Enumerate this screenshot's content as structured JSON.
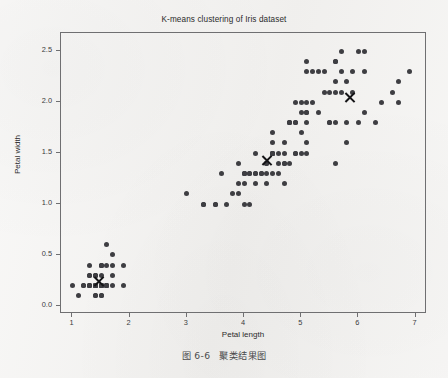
{
  "page": {
    "background_color": "#f3f2f0",
    "caption_number": "图 6-6",
    "caption_text": "聚类结果图"
  },
  "chart_data": {
    "type": "scatter",
    "title": "K-means clustering of Iris dataset",
    "xlabel": "Petal length",
    "ylabel": "Petal width",
    "xlim": [
      0.8,
      7.2
    ],
    "ylim": [
      -0.08,
      2.68
    ],
    "xticks": [
      1,
      2,
      3,
      4,
      5,
      6,
      7
    ],
    "xticklabels": [
      "1",
      "2",
      "3",
      "4",
      "5",
      "6",
      "7"
    ],
    "yticks": [
      0.0,
      0.5,
      1.0,
      1.5,
      2.0,
      2.5
    ],
    "yticklabels": [
      "0.0",
      "0.5",
      "1.0",
      "1.5",
      "2.0",
      "2.5"
    ],
    "grid": false,
    "legend": false,
    "marker_color": "#3e3e42",
    "centroid_color": "#141416",
    "centroid_marker": "x",
    "series": [
      {
        "name": "iris-samples",
        "marker": "o",
        "points": [
          [
            1.4,
            0.2
          ],
          [
            1.4,
            0.2
          ],
          [
            1.3,
            0.2
          ],
          [
            1.5,
            0.2
          ],
          [
            1.4,
            0.2
          ],
          [
            1.7,
            0.4
          ],
          [
            1.4,
            0.3
          ],
          [
            1.5,
            0.2
          ],
          [
            1.4,
            0.2
          ],
          [
            1.5,
            0.1
          ],
          [
            1.5,
            0.2
          ],
          [
            1.6,
            0.2
          ],
          [
            1.4,
            0.1
          ],
          [
            1.1,
            0.1
          ],
          [
            1.2,
            0.2
          ],
          [
            1.5,
            0.4
          ],
          [
            1.3,
            0.4
          ],
          [
            1.4,
            0.3
          ],
          [
            1.7,
            0.3
          ],
          [
            1.5,
            0.3
          ],
          [
            1.7,
            0.2
          ],
          [
            1.5,
            0.4
          ],
          [
            1.0,
            0.2
          ],
          [
            1.7,
            0.5
          ],
          [
            1.9,
            0.2
          ],
          [
            1.6,
            0.2
          ],
          [
            1.6,
            0.4
          ],
          [
            1.5,
            0.2
          ],
          [
            1.4,
            0.2
          ],
          [
            1.6,
            0.2
          ],
          [
            1.6,
            0.2
          ],
          [
            1.5,
            0.4
          ],
          [
            1.5,
            0.1
          ],
          [
            1.4,
            0.2
          ],
          [
            1.5,
            0.2
          ],
          [
            1.2,
            0.2
          ],
          [
            1.3,
            0.2
          ],
          [
            1.4,
            0.1
          ],
          [
            1.3,
            0.2
          ],
          [
            1.5,
            0.2
          ],
          [
            1.3,
            0.3
          ],
          [
            1.3,
            0.3
          ],
          [
            1.3,
            0.2
          ],
          [
            1.6,
            0.6
          ],
          [
            1.9,
            0.4
          ],
          [
            1.4,
            0.3
          ],
          [
            1.6,
            0.2
          ],
          [
            1.4,
            0.2
          ],
          [
            1.5,
            0.2
          ],
          [
            1.4,
            0.2
          ],
          [
            4.7,
            1.4
          ],
          [
            4.5,
            1.5
          ],
          [
            4.9,
            1.5
          ],
          [
            4.0,
            1.3
          ],
          [
            4.6,
            1.5
          ],
          [
            4.5,
            1.3
          ],
          [
            4.7,
            1.6
          ],
          [
            3.3,
            1.0
          ],
          [
            4.6,
            1.3
          ],
          [
            3.9,
            1.4
          ],
          [
            3.5,
            1.0
          ],
          [
            4.2,
            1.5
          ],
          [
            4.0,
            1.0
          ],
          [
            4.7,
            1.4
          ],
          [
            3.6,
            1.3
          ],
          [
            4.4,
            1.4
          ],
          [
            4.5,
            1.5
          ],
          [
            4.1,
            1.0
          ],
          [
            4.5,
            1.5
          ],
          [
            3.9,
            1.1
          ],
          [
            4.8,
            1.8
          ],
          [
            4.0,
            1.3
          ],
          [
            4.9,
            1.5
          ],
          [
            4.7,
            1.2
          ],
          [
            4.3,
            1.3
          ],
          [
            4.4,
            1.4
          ],
          [
            4.8,
            1.4
          ],
          [
            5.0,
            1.7
          ],
          [
            4.5,
            1.5
          ],
          [
            3.5,
            1.0
          ],
          [
            3.8,
            1.1
          ],
          [
            3.7,
            1.0
          ],
          [
            3.9,
            1.2
          ],
          [
            5.1,
            1.6
          ],
          [
            4.5,
            1.5
          ],
          [
            4.5,
            1.6
          ],
          [
            4.7,
            1.5
          ],
          [
            4.4,
            1.3
          ],
          [
            4.1,
            1.3
          ],
          [
            4.0,
            1.3
          ],
          [
            4.4,
            1.2
          ],
          [
            4.6,
            1.4
          ],
          [
            4.0,
            1.2
          ],
          [
            3.3,
            1.0
          ],
          [
            4.2,
            1.3
          ],
          [
            4.2,
            1.2
          ],
          [
            4.2,
            1.3
          ],
          [
            4.3,
            1.3
          ],
          [
            3.0,
            1.1
          ],
          [
            4.1,
            1.3
          ],
          [
            6.0,
            2.5
          ],
          [
            5.1,
            1.9
          ],
          [
            5.9,
            2.1
          ],
          [
            5.6,
            1.8
          ],
          [
            5.8,
            2.2
          ],
          [
            6.6,
            2.1
          ],
          [
            4.5,
            1.7
          ],
          [
            6.3,
            1.8
          ],
          [
            5.8,
            1.8
          ],
          [
            6.1,
            2.5
          ],
          [
            5.1,
            2.0
          ],
          [
            5.3,
            1.9
          ],
          [
            5.5,
            2.1
          ],
          [
            5.0,
            2.0
          ],
          [
            5.1,
            2.4
          ],
          [
            5.3,
            2.3
          ],
          [
            5.5,
            1.8
          ],
          [
            6.7,
            2.2
          ],
          [
            6.9,
            2.3
          ],
          [
            5.0,
            1.5
          ],
          [
            5.7,
            2.3
          ],
          [
            4.9,
            2.0
          ],
          [
            6.7,
            2.0
          ],
          [
            4.9,
            1.8
          ],
          [
            5.7,
            2.1
          ],
          [
            6.0,
            1.8
          ],
          [
            4.8,
            1.8
          ],
          [
            4.9,
            1.8
          ],
          [
            5.6,
            2.1
          ],
          [
            5.8,
            1.6
          ],
          [
            6.1,
            1.9
          ],
          [
            6.4,
            2.0
          ],
          [
            5.6,
            2.2
          ],
          [
            5.1,
            1.5
          ],
          [
            5.6,
            1.4
          ],
          [
            6.1,
            2.3
          ],
          [
            5.6,
            2.4
          ],
          [
            5.5,
            1.8
          ],
          [
            4.8,
            1.8
          ],
          [
            5.4,
            2.1
          ],
          [
            5.6,
            2.4
          ],
          [
            5.1,
            2.3
          ],
          [
            5.1,
            1.9
          ],
          [
            5.9,
            2.3
          ],
          [
            5.7,
            2.5
          ],
          [
            5.2,
            2.3
          ],
          [
            5.0,
            1.9
          ],
          [
            5.2,
            2.0
          ],
          [
            5.4,
            2.3
          ],
          [
            5.1,
            1.8
          ]
        ]
      }
    ],
    "centroids": [
      {
        "name": "centroid-1",
        "x": 1.46,
        "y": 0.24
      },
      {
        "name": "centroid-2",
        "x": 4.41,
        "y": 1.43
      },
      {
        "name": "centroid-3",
        "x": 5.86,
        "y": 2.05
      }
    ]
  }
}
